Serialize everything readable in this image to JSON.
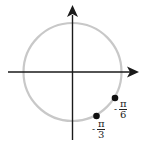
{
  "diagram": {
    "type": "unit-circle",
    "colors": {
      "circle": "#c8c8c8",
      "axes": "#1a1a1a",
      "points": "#111111"
    },
    "points": [
      {
        "id": "minus-pi-over-6",
        "sign": "-",
        "numerator": "π",
        "denominator": "6"
      },
      {
        "id": "minus-pi-over-3",
        "sign": "-",
        "numerator": "π",
        "denominator": "3"
      }
    ]
  }
}
